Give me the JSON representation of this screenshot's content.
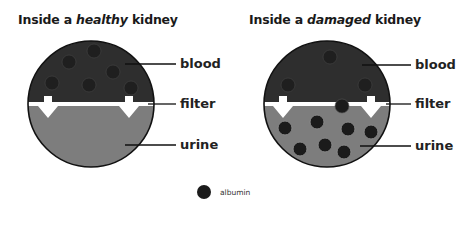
{
  "panels": [
    {
      "title_prefix": "Inside a ",
      "title_emphasis": "healthy",
      "title_suffix": " kidney",
      "labels": {
        "blood": "blood",
        "filter": "filter",
        "urine": "urine"
      },
      "blood_albumin_count": 6,
      "urine_albumin_count": 0
    },
    {
      "title_prefix": "Inside a ",
      "title_emphasis": "damaged",
      "title_suffix": " kidney",
      "labels": {
        "blood": "blood",
        "filter": "filter",
        "urine": "urine"
      },
      "blood_albumin_count": 3,
      "filter_albumin_count": 1,
      "urine_albumin_count": 8
    }
  ],
  "legend": {
    "label": "albumin",
    "icon": "albumin-dot-icon"
  },
  "colors": {
    "blood": "#2e2e2e",
    "urine": "#7d7d7d",
    "albumin": "#1b1b1b",
    "filter": "#ffffff",
    "outline": "#111111"
  }
}
